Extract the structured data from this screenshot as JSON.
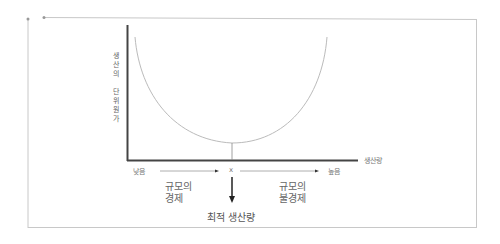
{
  "diagram": {
    "title": "",
    "y_axis_label": "생산의 단위원가",
    "y_axis_label_chars": [
      "생",
      "산",
      "의",
      "",
      "단",
      "위",
      "원",
      "가"
    ],
    "x_axis_label": "생산량",
    "x_low_label": "낮음",
    "x_high_label": "높음",
    "x_marker_label": "x",
    "left_region_label_line1": "규모의",
    "left_region_label_line2": "경제",
    "right_region_label_line1": "규모의",
    "right_region_label_line2": "불경제",
    "optimal_label": "최적 생산량",
    "curve": {
      "type": "U-shaped average cost curve",
      "minimum_at": "x"
    },
    "colors": {
      "axis": "#444444",
      "curve": "#bbbbbb",
      "frame": "#cccccc",
      "arrow": "#222222"
    }
  }
}
